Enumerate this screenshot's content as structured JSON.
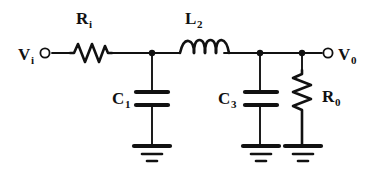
{
  "figure": {
    "background_color": "#ffffff",
    "ink_color": "#111111",
    "width": 379,
    "height": 176
  },
  "labels": {
    "input_terminal": {
      "base": "V",
      "sub": "i"
    },
    "output_terminal": {
      "base": "V",
      "sub": "0"
    },
    "series_resistor": {
      "base": "R",
      "sub": "i"
    },
    "series_inductor": {
      "base": "L",
      "sub": "2"
    },
    "shunt_capacitor_1": {
      "base": "C",
      "sub": "1"
    },
    "shunt_capacitor_3": {
      "base": "C",
      "sub": "3"
    },
    "load_resistor": {
      "base": "R",
      "sub": "0"
    }
  },
  "components": [
    {
      "name": "series-resistor",
      "type": "resistor",
      "orientation": "horizontal",
      "label": "R_i"
    },
    {
      "name": "series-inductor",
      "type": "inductor",
      "orientation": "horizontal",
      "label": "L_2",
      "loops": 4
    },
    {
      "name": "shunt-capacitor-1",
      "type": "capacitor",
      "orientation": "vertical",
      "label": "C_1"
    },
    {
      "name": "shunt-capacitor-3",
      "type": "capacitor",
      "orientation": "vertical",
      "label": "C_3"
    },
    {
      "name": "load-resistor",
      "type": "resistor",
      "orientation": "vertical",
      "label": "R_0"
    }
  ],
  "terminals": [
    {
      "name": "input-terminal",
      "label": "V_i",
      "style": "open-circle"
    },
    {
      "name": "output-terminal",
      "label": "V_0",
      "style": "open-circle"
    }
  ],
  "grounds": [
    {
      "name": "ground-c1",
      "bars": 3
    },
    {
      "name": "ground-c3",
      "bars": 3
    },
    {
      "name": "ground-r0",
      "bars": 3
    }
  ],
  "junctions": [
    {
      "name": "node-c1"
    },
    {
      "name": "node-c3"
    },
    {
      "name": "node-r0"
    }
  ]
}
